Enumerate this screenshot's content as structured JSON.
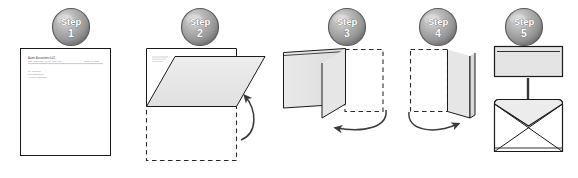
{
  "figure": {
    "step_count": 5,
    "background_color": "#ffffff"
  },
  "colors": {
    "paper_fill": "#ffffff",
    "fold_fill": "#e8e8e8",
    "panel_fill": "#e4e4e4",
    "flap_fill": "#ebebeb",
    "outline": "#1b1b1b",
    "dashed_outline": "#2a2a2a",
    "badge_light": "#cfcfcf",
    "badge_mid": "#a8a8a8",
    "badge_dark": "#7c7c7c",
    "badge_edge": "#5d5d5d",
    "badge_text": "#ffffff",
    "arrow": "#3a3a3a",
    "doc_text": "#8a8a8a"
  },
  "badges": [
    {
      "id": "step-1",
      "word": "Step",
      "number": "1",
      "cx": 71,
      "cy": 27
    },
    {
      "id": "step-2",
      "word": "Step",
      "number": "2",
      "cx": 200,
      "cy": 27
    },
    {
      "id": "step-3",
      "word": "Step",
      "number": "3",
      "cx": 347,
      "cy": 27
    },
    {
      "id": "step-4",
      "word": "Step",
      "number": "4",
      "cx": 438,
      "cy": 27
    },
    {
      "id": "step-5",
      "word": "Step",
      "number": "5",
      "cx": 524,
      "cy": 27
    }
  ],
  "steps": [
    {
      "id": "step-1",
      "number": "1",
      "label": "Step 1",
      "caption": "Unfolded letter on letterhead",
      "elements": [
        "letterhead-page",
        "letterhead-rule",
        "address-block"
      ]
    },
    {
      "id": "step-2",
      "number": "2",
      "label": "Step 2",
      "caption": "Fold the bottom third of the page upward",
      "elements": [
        "page-outline",
        "folded-flap",
        "dashed-ghost",
        "fold-arrow-up"
      ]
    },
    {
      "id": "step-3",
      "number": "3",
      "label": "Step 3",
      "caption": "Fold the right side toward the left",
      "elements": [
        "flat-panel",
        "standing-panel",
        "dashed-ghost",
        "fold-arrow-left"
      ]
    },
    {
      "id": "step-4",
      "number": "4",
      "label": "Step 4",
      "caption": "Fold the remaining side across",
      "elements": [
        "dashed-ghost",
        "standing-panel",
        "fold-arrow-right"
      ]
    },
    {
      "id": "step-5",
      "number": "5",
      "label": "Step 5",
      "caption": "Insert the folded letter into the envelope",
      "elements": [
        "folded-letter",
        "insert-arrow-down",
        "envelope"
      ]
    }
  ],
  "document": {
    "company": "Acme Associates LLC",
    "tagline": "1234 Corporate Avenue, Suite 100",
    "date": "March 14, 2011",
    "address_lines": [
      "Mr. John Doe",
      "5678 Oak Street",
      "Anytown, ST 00000"
    ]
  }
}
